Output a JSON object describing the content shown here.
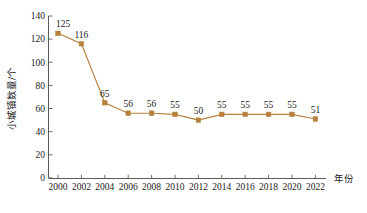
{
  "chart_data": {
    "type": "line",
    "title": "",
    "xlabel": "年份",
    "ylabel": "小城镇数量/个",
    "categories": [
      "2000",
      "2002",
      "2004",
      "2006",
      "2008",
      "2010",
      "2012",
      "2014",
      "2016",
      "2018",
      "2020",
      "2022"
    ],
    "values": [
      125,
      116,
      65,
      56,
      56,
      55,
      50,
      55,
      55,
      55,
      55,
      51
    ],
    "data_labels": [
      "125",
      "116",
      "65",
      "56",
      "56",
      "55",
      "50",
      "55",
      "55",
      "55",
      "55",
      "51"
    ],
    "ylim": [
      0,
      140
    ],
    "y_ticks": [
      "0",
      "20",
      "40",
      "60",
      "80",
      "100",
      "120",
      "140"
    ],
    "x_ticks": [
      "2000",
      "2002",
      "2004",
      "2006",
      "2008",
      "2010",
      "2012",
      "2014",
      "2016",
      "2018",
      "2020",
      "2022"
    ],
    "grid": false,
    "legend": "none",
    "series": [
      {
        "name": "小城镇数量",
        "values": [
          125,
          116,
          65,
          56,
          56,
          55,
          50,
          55,
          55,
          55,
          55,
          51
        ],
        "color": "#b5813c",
        "marker": "square"
      }
    ]
  },
  "axes": {
    "y_label": "小城镇数量/个",
    "x_label": "年份",
    "y_ticks": [
      "140",
      "120",
      "100",
      "80",
      "60",
      "40",
      "20",
      "0"
    ],
    "x_ticks": [
      "2000",
      "2002",
      "2004",
      "2006",
      "2008",
      "2010",
      "2012",
      "2014",
      "2016",
      "2018",
      "2020",
      "2022"
    ]
  },
  "labels": {
    "p0": "125",
    "p1": "116",
    "p2": "65",
    "p3": "56",
    "p4": "56",
    "p5": "55",
    "p6": "50",
    "p7": "55",
    "p8": "55",
    "p9": "55",
    "p10": "55",
    "p11": "51"
  },
  "colors": {
    "series": "#b5813c",
    "axis": "#4a4a4a",
    "text": "#1a1a1a"
  },
  "caption": ""
}
